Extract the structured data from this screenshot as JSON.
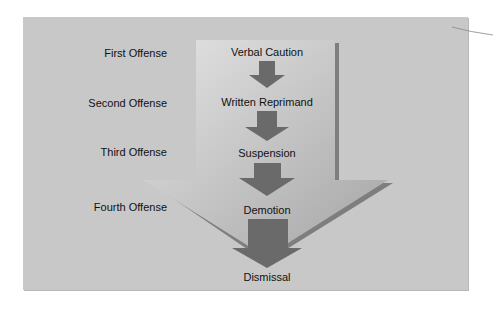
{
  "offenses": [
    "First Offense",
    "Second Offense",
    "Third Offense",
    "Fourth Offense"
  ],
  "steps": [
    "Verbal Caution",
    "Written Reprimand",
    "Suspension",
    "Demotion",
    "Dismissal"
  ],
  "colors": {
    "panel": "#c8c8c8",
    "big_arrow_light": "#dcdcdc",
    "big_arrow_dark": "#a8a8a8",
    "big_arrow_edge": "#7a7a7a",
    "small_arrow": "#6a6a6a",
    "text": "#111111"
  }
}
